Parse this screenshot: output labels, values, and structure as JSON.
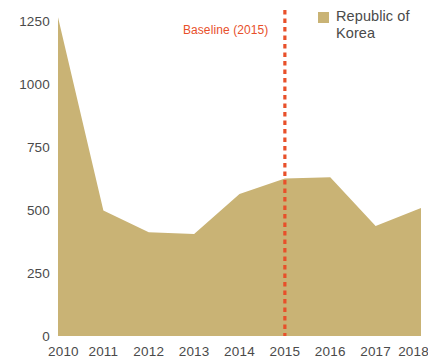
{
  "chart_data": {
    "type": "area",
    "title": "",
    "xlabel": "",
    "ylabel": "",
    "categories": [
      "2010",
      "2011",
      "2012",
      "2013",
      "2014",
      "2015",
      "2016",
      "2017",
      "2018"
    ],
    "x": [
      2010,
      2011,
      2012,
      2013,
      2014,
      2015,
      2016,
      2017,
      2018
    ],
    "series": [
      {
        "name": "Republic of Korea",
        "color": "#c9b375",
        "values": [
          1245,
          490,
          405,
          398,
          555,
          615,
          620,
          430,
          500
        ]
      }
    ],
    "ylim": [
      0,
      1250
    ],
    "xlim": [
      2010,
      2018
    ],
    "yticks": [
      0,
      250,
      500,
      750,
      1000,
      1250
    ],
    "ytick_labels": [
      "0",
      "250",
      "500",
      "750",
      "1000",
      "1250"
    ],
    "xtick_labels": [
      "2010",
      "2011",
      "2012",
      "2013",
      "2014",
      "2015",
      "2016",
      "2017",
      "2018"
    ],
    "grid": false,
    "legend_position": "top-right",
    "annotations": [
      {
        "text": "Baseline (2015)",
        "x": 2015,
        "type": "vertical-dotted-line",
        "color": "#e8502a"
      }
    ]
  },
  "legend": {
    "items": [
      {
        "label": "Republic of Korea",
        "color": "#c9b375"
      }
    ]
  },
  "annotation": {
    "baseline_label": "Baseline (2015)"
  },
  "colors": {
    "area_fill": "#c9b375",
    "accent": "#e8502a",
    "axis_text": "#4a4a4a",
    "background": "#ffffff"
  }
}
